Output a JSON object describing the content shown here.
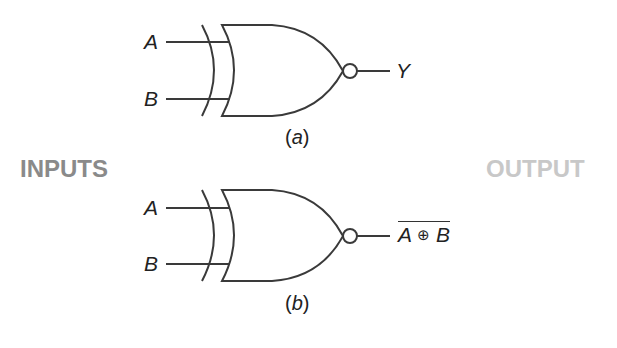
{
  "labels": {
    "inputs": "INPUTS",
    "output": "OUTPUT"
  },
  "gate_a": {
    "type": "XNOR",
    "input_a": "A",
    "input_b": "B",
    "output": "Y",
    "caption_open": "(",
    "caption_letter": "a",
    "caption_close": ")"
  },
  "gate_b": {
    "type": "XNOR",
    "input_a": "A",
    "input_b": "B",
    "output_a": "A",
    "output_op": "⊕",
    "output_b": "B",
    "caption_open": "(",
    "caption_letter": "b",
    "caption_close": ")"
  },
  "colors": {
    "stroke": "#3a3a3a",
    "inputs_label": "#8a8a8a",
    "output_label": "#c8c8c8"
  }
}
